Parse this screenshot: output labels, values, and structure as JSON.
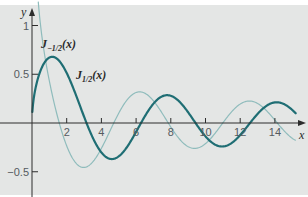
{
  "chart_data": {
    "type": "line",
    "title": "",
    "xlabel": "x",
    "ylabel": "y",
    "xlim": [
      0,
      15.3
    ],
    "ylim": [
      -0.6,
      1.1
    ],
    "grid": false,
    "x_ticks": [
      2,
      4,
      6,
      8,
      10,
      12,
      14
    ],
    "x_tick_labels": [
      "2",
      "4",
      "6",
      "8",
      "10",
      "12",
      "14"
    ],
    "y_ticks": [
      1,
      0.5,
      -0.5
    ],
    "y_tick_labels": [
      "1",
      "0.5",
      "−0.5"
    ],
    "series": [
      {
        "name": "J_{-1/2}(x)",
        "label_main": "J",
        "label_sub": "−1/2",
        "label_arg": "(x)",
        "formula": "sqrt(2/(pi x)) cos(x)",
        "color": "#8fbcbc",
        "x_range": [
          0.36,
          15.2
        ],
        "sample_points": [
          [
            0.5,
            0.99
          ],
          [
            1,
            0.43
          ],
          [
            2,
            -0.23
          ],
          [
            3,
            -0.46
          ],
          [
            4,
            -0.26
          ],
          [
            5,
            0.1
          ],
          [
            6,
            0.31
          ],
          [
            7,
            0.23
          ],
          [
            8,
            -0.04
          ],
          [
            9,
            -0.24
          ],
          [
            10,
            -0.21
          ],
          [
            11,
            0.0
          ],
          [
            12,
            0.19
          ],
          [
            13,
            0.2
          ],
          [
            14,
            0.03
          ],
          [
            15,
            -0.16
          ]
        ]
      },
      {
        "name": "J_{1/2}(x)",
        "label_main": "J",
        "label_sub": "1/2",
        "label_arg": "(x)",
        "formula": "sqrt(2/(pi x)) sin(x)",
        "color": "#1f6e74",
        "x_range": [
          0.02,
          15.2
        ],
        "sample_points": [
          [
            0.5,
            0.54
          ],
          [
            1.17,
            0.67
          ],
          [
            2,
            0.51
          ],
          [
            3,
            0.07
          ],
          [
            4,
            -0.3
          ],
          [
            5,
            -0.34
          ],
          [
            6,
            -0.09
          ],
          [
            7,
            0.2
          ],
          [
            8,
            0.28
          ],
          [
            9,
            0.11
          ],
          [
            10,
            -0.14
          ],
          [
            11,
            -0.24
          ],
          [
            12,
            -0.12
          ],
          [
            13,
            0.09
          ],
          [
            14,
            0.21
          ],
          [
            15,
            0.13
          ]
        ]
      }
    ],
    "annotations": [
      {
        "text": "J_{-1/2}(x)",
        "near": [
          0.5,
          0.85
        ]
      },
      {
        "text": "J_{1/2}(x)",
        "near": [
          2.6,
          0.5
        ]
      }
    ],
    "legend_position": "none (inline labels)"
  },
  "style": {
    "background": "#e4e6e5",
    "axis_color": "#2c2c2c"
  }
}
